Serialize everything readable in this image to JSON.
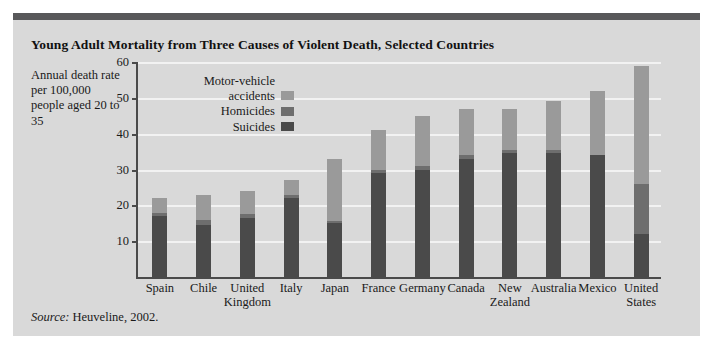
{
  "title": "Young Adult Mortality from Three Causes of Violent Death, Selected Countries",
  "axis_caption": "Annual death rate per 100,000 people aged 20 to 35",
  "source_prefix": "Source:",
  "source_text": "Heuveline, 2002.",
  "colors": {
    "panel": "#d9d9d9",
    "top_rule": "#58585a",
    "motor_vehicle": "#9a9a9a",
    "homicides": "#6e6e6e",
    "suicides": "#4a4a4a",
    "axis": "#4a4a4a",
    "gridline": "#f2f2f2"
  },
  "chart_data": {
    "type": "bar",
    "title": "Young Adult Mortality from Three Causes of Violent Death, Selected Countries",
    "xlabel": "",
    "ylabel": "Annual death rate per 100,000 people aged 20 to 35",
    "ylim": [
      0,
      60
    ],
    "yticks": [
      10,
      20,
      30,
      40,
      50,
      60
    ],
    "grid": true,
    "stacked": true,
    "legend_position": "inside-top-left",
    "categories": [
      "Spain",
      "Chile",
      "United\nKingdom",
      "Italy",
      "Japan",
      "France",
      "Germany",
      "Canada",
      "New\nZealand",
      "Australia",
      "Mexico",
      "United\nStates"
    ],
    "series": [
      {
        "name": "Suicides",
        "values": [
          17.0,
          14.5,
          16.5,
          22.0,
          15.0,
          29.0,
          30.0,
          33.0,
          34.5,
          34.5,
          34.0,
          12.0
        ]
      },
      {
        "name": "Homicides",
        "values": [
          1.0,
          1.5,
          1.0,
          1.0,
          0.5,
          1.0,
          1.0,
          1.0,
          1.0,
          1.0,
          0.0,
          14.0
        ]
      },
      {
        "name": "Motor-vehicle\naccidents",
        "values": [
          4.0,
          7.0,
          6.5,
          4.0,
          17.5,
          11.0,
          14.0,
          13.0,
          11.5,
          13.5,
          18.0,
          33.0
        ]
      }
    ],
    "totals": [
      22.0,
      23.0,
      24.0,
      27.0,
      33.0,
      41.0,
      45.0,
      47.0,
      47.0,
      49.0,
      52.0,
      59.0
    ]
  },
  "legend": [
    {
      "label": "Motor-vehicle\naccidents",
      "color": "#9a9a9a"
    },
    {
      "label": "Homicides",
      "color": "#6e6e6e"
    },
    {
      "label": "Suicides",
      "color": "#4a4a4a"
    }
  ]
}
